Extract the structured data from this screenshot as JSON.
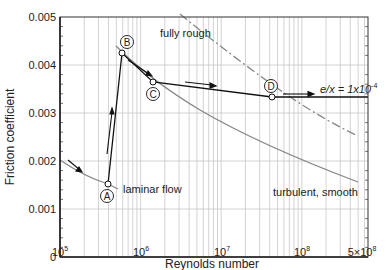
{
  "chart_data": {
    "type": "line",
    "title": "",
    "xlabel": "Reynolds number",
    "ylabel": "Friction coefficient",
    "xscale": "log",
    "xlim": [
      100000,
      680000000
    ],
    "ylim": [
      0,
      0.005
    ],
    "grid": true,
    "x_ticks": [
      {
        "value": 100000,
        "base": "10",
        "exp": "5",
        "prefix": ""
      },
      {
        "value": 1000000,
        "base": "10",
        "exp": "6",
        "prefix": ""
      },
      {
        "value": 10000000,
        "base": "10",
        "exp": "7",
        "prefix": ""
      },
      {
        "value": 100000000,
        "base": "10",
        "exp": "8",
        "prefix": ""
      },
      {
        "value": 500000000,
        "base": "10",
        "exp": "8",
        "prefix": "5×"
      }
    ],
    "y_ticks": [
      {
        "value": 0,
        "label": "0"
      },
      {
        "value": 0.001,
        "label": "0.001"
      },
      {
        "value": 0.002,
        "label": "0.002"
      },
      {
        "value": 0.003,
        "label": "0.003"
      },
      {
        "value": 0.004,
        "label": "0.004"
      },
      {
        "value": 0.005,
        "label": "0.005"
      }
    ],
    "series": [
      {
        "name": "laminar flow",
        "style": "gray solid",
        "x": [
          100000,
          200000,
          400000,
          500000
        ],
        "y": [
          0.0021,
          0.00148,
          0.00105,
          0.00094
        ]
      },
      {
        "name": "turbulent, smooth",
        "style": "gray solid",
        "x": [
          550000,
          1000000,
          3000000,
          10000000,
          30000000,
          100000000,
          500000000
        ],
        "y": [
          0.0044,
          0.0039,
          0.0034,
          0.0029,
          0.0025,
          0.0022,
          0.0018
        ]
      },
      {
        "name": "fully rough",
        "style": "gray dash-dot",
        "x": [
          1500000,
          3000000,
          10000000,
          30000000,
          100000000,
          500000000
        ],
        "y": [
          0.0051,
          0.0046,
          0.0039,
          0.0033,
          0.0028,
          0.0022
        ]
      },
      {
        "name": "transition path",
        "style": "black solid",
        "x": [
          400000,
          600000,
          1400000,
          35000000,
          680000000
        ],
        "y": [
          0.00105,
          0.00425,
          0.00345,
          0.0031,
          0.0031
        ]
      }
    ],
    "points": [
      {
        "label": "A",
        "x": 400000,
        "y": 0.00105
      },
      {
        "label": "B",
        "x": 600000,
        "y": 0.00425
      },
      {
        "label": "C",
        "x": 1400000,
        "y": 0.00345
      },
      {
        "label": "D",
        "x": 35000000,
        "y": 0.0031
      }
    ],
    "annotations": [
      {
        "text": "laminar flow"
      },
      {
        "text": "turbulent, smooth"
      },
      {
        "text": "fully rough"
      },
      {
        "text": "e/x = 1x10",
        "sup": "-4"
      }
    ]
  },
  "labels": {
    "xlabel": "Reynolds number",
    "ylabel": "Friction coefficient",
    "laminar": "laminar flow",
    "turbulent": "turbulent, smooth",
    "rough": "fully rough",
    "roughness_main": "e/x = 1x10",
    "roughness_sup": "-4",
    "pointA": "A",
    "pointB": "B",
    "pointC": "C",
    "pointD": "D",
    "y0": "0",
    "y1": "0.001",
    "y2": "0.002",
    "y3": "0.003",
    "y4": "0.004",
    "y5": "0.005",
    "x5": "10",
    "x5e": "5",
    "x6": "10",
    "x6e": "6",
    "x7": "10",
    "x7e": "7",
    "x8": "10",
    "x8e": "8",
    "x58": "5×10",
    "x58e": "8"
  }
}
